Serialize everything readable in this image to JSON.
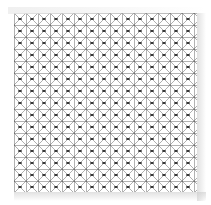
{
  "artwork": {
    "title": "Square lattice mesh pattern swatch",
    "type": "geometric-tiling",
    "description": "Repeating square grid with diagonal cross-bracing forming diamonds, dark nodes at intersections",
    "background_color": "#ffffff",
    "line_color": "#555555",
    "diagonal_color": "#8c8c8c",
    "node_color": "#2b2b2b",
    "edge_shadow_color": "#c8c8c8"
  },
  "canvas": {
    "width": 211,
    "height": 205
  },
  "pattern": {
    "origin_x": 14,
    "origin_y": 13,
    "width": 183,
    "height": 179,
    "cell_size": 12,
    "columns": 16,
    "rows": 15,
    "grid_line_width": 0.9,
    "diagonal_line_width": 0.7,
    "node_radius": 1.9,
    "node_width": 4.2,
    "node_height": 2.0,
    "motifs": [
      "vertical-grid-lines",
      "horizontal-grid-lines",
      "diagonal-cross-bracing",
      "intersection-nodes"
    ]
  },
  "labels": {
    "swatch_name": "lattice-swatch",
    "alt_text": "Seamless grey lattice grid pattern on white"
  }
}
